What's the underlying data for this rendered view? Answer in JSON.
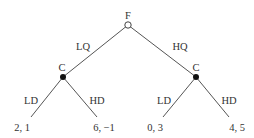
{
  "tree": {
    "root": {
      "player": "F",
      "type": "open"
    },
    "root_actions": [
      "LQ",
      "HQ"
    ],
    "nodes": [
      {
        "player": "C",
        "type": "filled",
        "actions": [
          "LD",
          "HD"
        ]
      },
      {
        "player": "C",
        "type": "filled",
        "actions": [
          "LD",
          "HD"
        ]
      }
    ],
    "payoffs": [
      "2, 1",
      "6, −1",
      "0, 3",
      "4, 5"
    ]
  },
  "colors": {
    "line": "#555555",
    "text": "#333333",
    "node": "#111111"
  }
}
